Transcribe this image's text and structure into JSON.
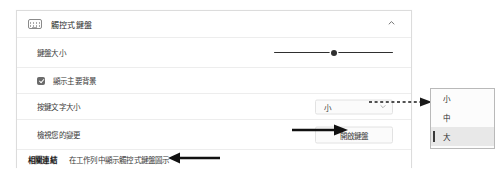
{
  "card": {
    "header": {
      "icon": "keyboard-icon",
      "title": "觸控式鍵盤",
      "collapse_icon": "chevron-up-icon"
    },
    "rows": {
      "keyboard_size": {
        "label": "鍵盤大小",
        "slider_value_percent": 50
      },
      "show_key_background": {
        "label": "顯示主要背景",
        "checked": true
      },
      "key_text_size": {
        "label": "按鍵文字大小",
        "value": "小",
        "chevron_icon": "chevron-down-icon"
      },
      "view_changes": {
        "label": "檢視您的變更",
        "button_label": "開啟鍵盤"
      }
    },
    "related_links": {
      "heading": "相關連結",
      "link": "在工作列中顯示觸控式鍵盤圖示"
    }
  },
  "menu": {
    "items": [
      {
        "label": "小",
        "selected": false
      },
      {
        "label": "中",
        "selected": false
      },
      {
        "label": "大",
        "selected": true
      }
    ]
  },
  "annotations": {
    "arrow_to_open_keyboard": "arrow-right-icon",
    "arrow_to_related_links": "arrow-left-icon",
    "arrow_dashed_to_menu": "dashed-arrow-right-icon"
  },
  "colors": {
    "card_border": "#dcdcdc",
    "row_divider": "#ededed",
    "text_primary": "#2b2b2b",
    "text_secondary": "#3a3a3a",
    "slider_track": "#2f2f2f",
    "menu_selected_bg": "#e8e8e8",
    "annotation_arrow": "#111111"
  }
}
